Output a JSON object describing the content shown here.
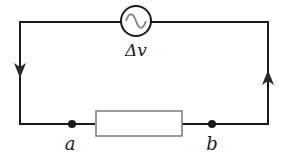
{
  "diagram": {
    "type": "circuit",
    "source": {
      "kind": "AC voltage source",
      "icon": "ac-sine-icon",
      "label": "Δv"
    },
    "resistor": {
      "kind": "resistor"
    },
    "nodes": [
      {
        "id": "a",
        "label": "a"
      },
      {
        "id": "b",
        "label": "b"
      }
    ],
    "current_arrows": [
      {
        "side": "left",
        "direction": "down"
      },
      {
        "side": "right",
        "direction": "up"
      }
    ],
    "colors": {
      "wire": "#1a1a1a",
      "sine": "#8a8a8a",
      "resistor": "#7a7a7a"
    }
  }
}
